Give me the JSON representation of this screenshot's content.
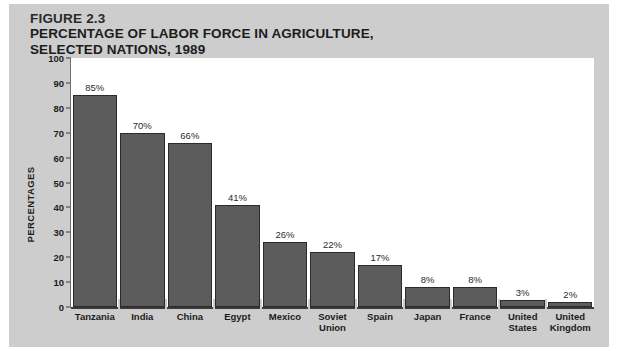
{
  "figure": {
    "number_label": "FIGURE 2.3",
    "title_line1": "PERCENTAGE OF LABOR FORCE IN AGRICULTURE,",
    "title_line2": "SELECTED NATIONS, 1989",
    "panel_color": "#cdcdcd",
    "plot_background": "#ffffff",
    "bar_color": "#5c5c5c",
    "bar_outline_color": "#2b2b2b",
    "text_color": "#1c1c1c"
  },
  "chart_data": {
    "type": "bar",
    "title": "PERCENTAGE OF LABOR FORCE IN AGRICULTURE, SELECTED NATIONS, 1989",
    "xlabel": "",
    "ylabel": "PERCENTAGES",
    "ylim": [
      0,
      100
    ],
    "ytick_step": 10,
    "grid": false,
    "legend": "none",
    "categories": [
      "Tanzania",
      "India",
      "China",
      "Egypt",
      "Mexico",
      "Soviet Union",
      "Spain",
      "Japan",
      "France",
      "United States",
      "United Kingdom"
    ],
    "category_lines": [
      [
        "Tanzania"
      ],
      [
        "India"
      ],
      [
        "China"
      ],
      [
        "Egypt"
      ],
      [
        "Mexico"
      ],
      [
        "Soviet",
        "Union"
      ],
      [
        "Spain"
      ],
      [
        "Japan"
      ],
      [
        "France"
      ],
      [
        "United",
        "States"
      ],
      [
        "United",
        "Kingdom"
      ]
    ],
    "values": [
      85,
      70,
      66,
      41,
      26,
      22,
      17,
      8,
      8,
      3,
      2
    ],
    "value_labels": [
      "85%",
      "70%",
      "66%",
      "41%",
      "26%",
      "22%",
      "17%",
      "8%",
      "8%",
      "3%",
      "2%"
    ],
    "ytick_labels": [
      "100",
      "90",
      "80",
      "70",
      "60",
      "50",
      "40",
      "30",
      "20",
      "10",
      "0"
    ],
    "ytick_values": [
      100,
      90,
      80,
      70,
      60,
      50,
      40,
      30,
      20,
      10,
      0
    ]
  }
}
